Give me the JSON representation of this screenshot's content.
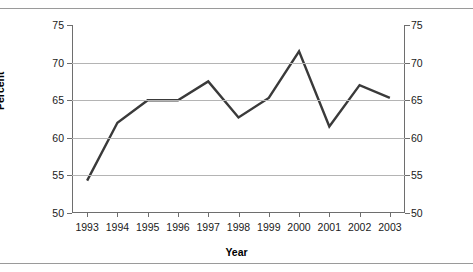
{
  "chart_data": {
    "type": "line",
    "title": "",
    "xlabel": "Year",
    "ylabel": "Percent",
    "categories": [
      "1993",
      "1994",
      "1995",
      "1996",
      "1997",
      "1998",
      "1999",
      "2000",
      "2001",
      "2002",
      "2003"
    ],
    "values": [
      54.3,
      62.0,
      65.0,
      65.0,
      67.5,
      62.7,
      65.3,
      71.5,
      61.5,
      67.0,
      65.3
    ],
    "series": [
      {
        "name": "Percent",
        "values": [
          54.3,
          62.0,
          65.0,
          65.0,
          67.5,
          62.7,
          65.3,
          71.5,
          61.5,
          67.0,
          65.3
        ]
      }
    ],
    "ylim": [
      50,
      75
    ],
    "y_ticks": [
      50,
      55,
      60,
      65,
      70,
      75
    ],
    "y_tick_labels": [
      "50",
      "55",
      "60",
      "65",
      "70",
      "75"
    ],
    "y_axis_duplicated_right": true,
    "gridlines": [
      55,
      60,
      65,
      70
    ],
    "grid": "horizontal",
    "legend": "none",
    "line_color": "#3a3a3a",
    "grid_color": "#b4b4b4",
    "axis_color": "#6e6e6e"
  }
}
